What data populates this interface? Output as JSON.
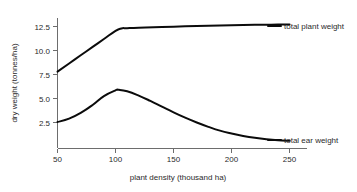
{
  "chart_data": {
    "type": "line",
    "title": "",
    "xlabel": "plant density (thousand ha)",
    "ylabel": "dry weight (tonnes/ha)",
    "xlim": [
      50,
      265
    ],
    "ylim": [
      0,
      13.6
    ],
    "grid": false,
    "legend_position": "inline-right-of-curves",
    "xticks": [
      "50",
      "100",
      "150",
      "200",
      "250"
    ],
    "xtick_values": [
      50,
      100,
      150,
      200,
      250
    ],
    "yticks": [
      "2.5",
      "5.0",
      "7.5",
      "10.0",
      "12.5"
    ],
    "ytick_values": [
      2.5,
      5.0,
      7.5,
      10.0,
      12.5
    ],
    "series": [
      {
        "name": "total plant weight",
        "label": "total plant weight",
        "color": "#0b0b0b",
        "x": [
          50,
          60,
          70,
          80,
          90,
          100,
          105,
          110,
          120,
          140,
          160,
          180,
          200,
          220,
          240,
          250
        ],
        "values": [
          7.8,
          8.65,
          9.5,
          10.35,
          11.2,
          12.05,
          12.3,
          12.33,
          12.38,
          12.45,
          12.52,
          12.58,
          12.63,
          12.67,
          12.7,
          12.72
        ]
      },
      {
        "name": "total ear weight",
        "label": "total ear weight",
        "color": "#0b0b0b",
        "x": [
          50,
          60,
          70,
          80,
          90,
          100,
          103,
          110,
          120,
          130,
          140,
          150,
          160,
          170,
          180,
          190,
          200,
          210,
          220,
          230,
          240,
          250
        ],
        "values": [
          2.55,
          2.9,
          3.5,
          4.3,
          5.25,
          5.85,
          5.9,
          5.75,
          5.3,
          4.75,
          4.15,
          3.55,
          3.0,
          2.5,
          2.05,
          1.65,
          1.35,
          1.1,
          0.9,
          0.75,
          0.65,
          0.6
        ]
      }
    ]
  }
}
